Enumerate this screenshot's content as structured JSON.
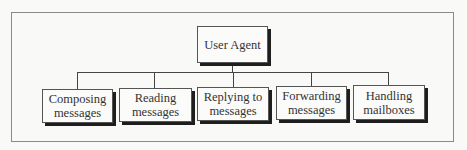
{
  "diagram": {
    "type": "hierarchy-tree",
    "root": {
      "label": "User Agent"
    },
    "children": [
      {
        "line1": "Composing",
        "line2": "messages"
      },
      {
        "line1": "Reading",
        "line2": "messages"
      },
      {
        "line1": "Replying to",
        "line2": "messages"
      },
      {
        "line1": "Forwarding",
        "line2": "messages"
      },
      {
        "line1": "Handling",
        "line2": "mailboxes"
      }
    ],
    "colors": {
      "background": "#f9f9f8",
      "border": "#555555",
      "shadow": "#1e1e1e",
      "frame": "#8a8a8a",
      "text": "#333333"
    }
  }
}
